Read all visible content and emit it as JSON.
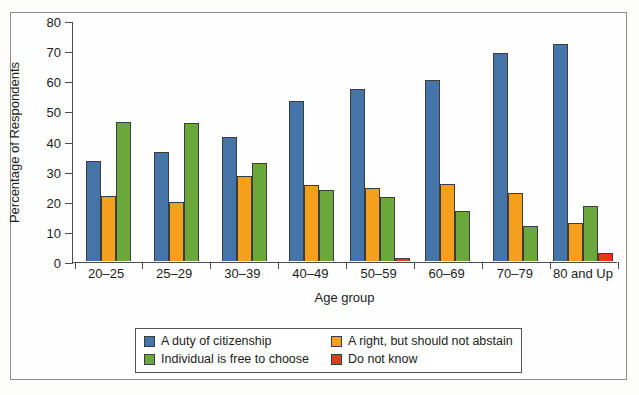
{
  "chart_data": {
    "type": "bar",
    "title": "",
    "xlabel": "Age group",
    "ylabel": "Percentage of Respondents",
    "ylim": [
      0,
      80
    ],
    "yticks": [
      0,
      10,
      20,
      30,
      40,
      50,
      60,
      70,
      80
    ],
    "grid": false,
    "legend_position": "bottom",
    "categories": [
      "20–25",
      "25–29",
      "30–39",
      "40–49",
      "50–59",
      "60–69",
      "70–79",
      "80 and Up"
    ],
    "series": [
      {
        "name": "A duty of citizenship",
        "color": "#4574a8",
        "values": [
          33,
          36,
          41,
          53,
          57,
          60,
          69,
          72
        ]
      },
      {
        "name": "A right, but should not abstain",
        "color": "#f4a01c",
        "values": [
          21.5,
          19.5,
          28,
          25,
          24,
          25.5,
          22.5,
          12.5
        ]
      },
      {
        "name": "Individual is free to choose",
        "color": "#6aa83c",
        "values": [
          46,
          45.5,
          32.5,
          23.5,
          21,
          16.5,
          11.5,
          18
        ]
      },
      {
        "name": "Do not know",
        "color": "#e8381d",
        "values": [
          0,
          0,
          0,
          0,
          1,
          0,
          0,
          2.5
        ]
      }
    ]
  }
}
